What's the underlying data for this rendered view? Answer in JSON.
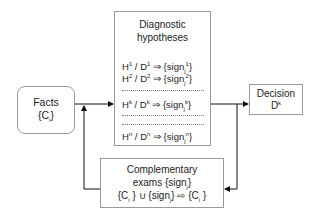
{
  "facts": {
    "title": "Facts",
    "set": "{C",
    "set_sub": "i",
    "set_close": "}"
  },
  "diagnostic": {
    "title_line1": "Diagnostic",
    "title_line2": "hypotheses",
    "rows": [
      {
        "h": "H",
        "h_sup": "1",
        "d": " / D",
        "d_sup": "1",
        "arrow": " ⇒ {sign",
        "sub": "j",
        "s_sup": "1",
        "close": "}"
      },
      {
        "h": "H",
        "h_sup": "2",
        "d": " / D",
        "d_sup": "2",
        "arrow": " ⇒ {sign",
        "sub": "j",
        "s_sup": "2",
        "close": "}"
      },
      {
        "h": "H",
        "h_sup": "k",
        "d": " / D",
        "d_sup": "k",
        "arrow": " ⇒  {sign",
        "sub": "j",
        "s_sup": "k",
        "close": "}"
      },
      {
        "h": "H",
        "h_sup": "n",
        "d": " / D",
        "d_sup": "n",
        "arrow": " ⇒  {sign",
        "sub": "j",
        "s_sup": "n",
        "close": "}"
      }
    ]
  },
  "decision": {
    "title": "Decision",
    "value": "D",
    "value_sup": "k"
  },
  "complementary": {
    "line1": "Complementary",
    "line2_a": "exams {sign",
    "line2_sub": "j",
    "line2_b": "}",
    "line3_a": "{C",
    "line3_sub1": "i",
    "line3_b": " } ∪ {sign",
    "line3_sub2": "j",
    "line3_c": "} ⇨ {C",
    "line3_sub3": "i",
    "line3_d": " }"
  },
  "colors": {
    "line": "#111111",
    "border": "#9a9a9a"
  }
}
